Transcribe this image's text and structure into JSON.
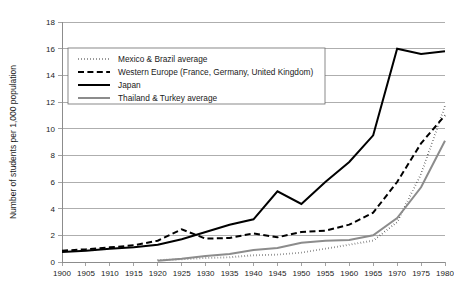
{
  "chart_data": {
    "type": "line",
    "title": "",
    "xlabel": "",
    "ylabel": "Number of students per 1,000 population",
    "xlim": [
      1900,
      1980
    ],
    "ylim": [
      0,
      18
    ],
    "ytick_step": 2,
    "grid": true,
    "legend_position": "upper-left",
    "x": [
      1900,
      1905,
      1910,
      1915,
      1920,
      1925,
      1930,
      1935,
      1940,
      1945,
      1950,
      1955,
      1960,
      1965,
      1970,
      1975,
      1980
    ],
    "xticks": [
      "1900",
      "1905",
      "1910",
      "1915",
      "1920",
      "1925",
      "1930",
      "1935",
      "1940",
      "1945",
      "1950",
      "1955",
      "1960",
      "1965",
      "1970",
      "1975",
      "1980"
    ],
    "yticks": [
      "0",
      "2",
      "4",
      "6",
      "8",
      "10",
      "12",
      "14",
      "16",
      "18"
    ],
    "series": [
      {
        "name": "Mexico & Brazil average",
        "style": "dotted",
        "color": "#000000",
        "width": 1.9,
        "dash": "0.4,2.6",
        "start_index": 4,
        "values": [
          null,
          null,
          null,
          null,
          0.15,
          0.2,
          0.3,
          0.35,
          0.5,
          0.55,
          0.7,
          1.0,
          1.3,
          1.6,
          3.0,
          6.6,
          11.7
        ]
      },
      {
        "name": "Western Europe (France, Germany, United Kingdom)",
        "style": "dashed",
        "color": "#000000",
        "width": 2.0,
        "dash": "6,3.4",
        "start_index": 0,
        "values": [
          0.85,
          0.95,
          1.1,
          1.25,
          1.6,
          2.45,
          1.75,
          1.8,
          2.15,
          1.85,
          2.25,
          2.35,
          2.8,
          3.7,
          6.0,
          8.9,
          11.0
        ]
      },
      {
        "name": "Japan",
        "style": "solid",
        "color": "#000000",
        "width": 2.0,
        "dash": "none",
        "start_index": 0,
        "values": [
          0.75,
          0.85,
          1.0,
          1.1,
          1.3,
          1.7,
          2.25,
          2.8,
          3.2,
          5.3,
          4.35,
          6.0,
          7.5,
          9.5,
          16.0,
          15.6,
          15.8
        ]
      },
      {
        "name": "Thailand & Turkey average",
        "style": "solid",
        "color": "#8c8c8c",
        "width": 2.0,
        "dash": "none",
        "start_index": 4,
        "values": [
          null,
          null,
          null,
          null,
          0.1,
          0.25,
          0.45,
          0.6,
          0.9,
          1.05,
          1.45,
          1.6,
          1.65,
          2.0,
          3.3,
          5.6,
          9.1
        ]
      }
    ]
  },
  "legend": {
    "items": [
      {
        "label": "Mexico & Brazil average"
      },
      {
        "label": "Western Europe (France, Germany, United Kingdom)"
      },
      {
        "label": "Japan"
      },
      {
        "label": "Thailand & Turkey average"
      }
    ]
  }
}
